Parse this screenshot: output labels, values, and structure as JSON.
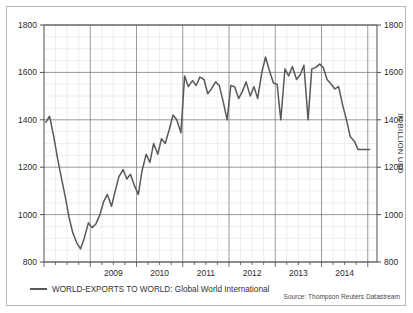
{
  "chart_data": {
    "type": "line",
    "title": "",
    "xlabel": "",
    "ylabel": "IN BILLION USD",
    "ylim": [
      800,
      1800
    ],
    "xlim": [
      2008.0,
      2015.2
    ],
    "grid": true,
    "legend_position": "bottom-left",
    "source": "Source: Thompson Reuters Datastream",
    "y_ticks": [
      800,
      1000,
      1200,
      1400,
      1600,
      1800
    ],
    "y_tick_labels": [
      "800",
      "1000",
      "1200",
      "1400",
      "1600",
      "1800"
    ],
    "x_ticks": [
      2009,
      2010,
      2011,
      2012,
      2013,
      2014
    ],
    "x_tick_labels": [
      "2009",
      "2010",
      "2011",
      "2012",
      "2013",
      "2014"
    ],
    "series": [
      {
        "name": "WORLD-EXPORTS TO WORLD: Global World International",
        "color": "#595959",
        "x": [
          2008.04,
          2008.12,
          2008.21,
          2008.29,
          2008.37,
          2008.46,
          2008.54,
          2008.62,
          2008.71,
          2008.79,
          2008.87,
          2008.96,
          2009.04,
          2009.12,
          2009.21,
          2009.29,
          2009.37,
          2009.46,
          2009.54,
          2009.62,
          2009.71,
          2009.79,
          2009.87,
          2009.96,
          2010.04,
          2010.12,
          2010.21,
          2010.29,
          2010.37,
          2010.46,
          2010.54,
          2010.62,
          2010.71,
          2010.79,
          2010.87,
          2010.96,
          2011.04,
          2011.12,
          2011.21,
          2011.29,
          2011.37,
          2011.46,
          2011.54,
          2011.62,
          2011.71,
          2011.79,
          2011.87,
          2011.96,
          2012.04,
          2012.12,
          2012.21,
          2012.29,
          2012.37,
          2012.46,
          2012.54,
          2012.62,
          2012.71,
          2012.79,
          2012.87,
          2012.96,
          2013.04,
          2013.12,
          2013.21,
          2013.29,
          2013.37,
          2013.46,
          2013.54,
          2013.62,
          2013.71,
          2013.79,
          2013.87,
          2013.96,
          2014.04,
          2014.12,
          2014.21,
          2014.29,
          2014.37,
          2014.46,
          2014.54,
          2014.62,
          2014.71,
          2014.79,
          2014.87,
          2014.96,
          2015.04
        ],
        "values": [
          1390,
          1415,
          1330,
          1240,
          1160,
          1075,
          990,
          925,
          880,
          855,
          900,
          965,
          945,
          960,
          1000,
          1055,
          1085,
          1035,
          1100,
          1160,
          1190,
          1150,
          1170,
          1120,
          1085,
          1185,
          1255,
          1220,
          1300,
          1255,
          1320,
          1300,
          1360,
          1420,
          1400,
          1345,
          1585,
          1540,
          1565,
          1545,
          1580,
          1570,
          1510,
          1530,
          1560,
          1545,
          1480,
          1400,
          1545,
          1540,
          1490,
          1520,
          1560,
          1500,
          1540,
          1490,
          1600,
          1665,
          1610,
          1555,
          1550,
          1400,
          1615,
          1585,
          1625,
          1570,
          1590,
          1630,
          1400,
          1615,
          1620,
          1635,
          1620,
          1570,
          1550,
          1530,
          1540,
          1460,
          1400,
          1330,
          1310,
          1275,
          1275,
          1275,
          1275
        ]
      }
    ]
  },
  "legend": {
    "label": "WORLD-EXPORTS TO WORLD: Global World International",
    "swatch_color": "#595959"
  },
  "axis": {
    "right_title": "IN BILLION USD"
  },
  "footer": {
    "source": "Source: Thompson Reuters Datastream"
  }
}
